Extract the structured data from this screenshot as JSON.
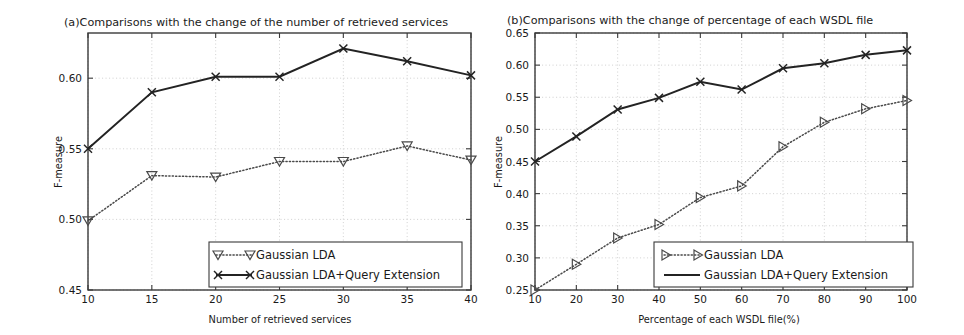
{
  "figure": {
    "background_color": "#ffffff",
    "line_color": "#232323",
    "dotted_color": "#4a4a4a",
    "grid_color": "#c9c9c9"
  },
  "panel_a": {
    "title": "(a)Comparisons with the change of the number of retrieved services",
    "xlabel": "Number of retrieved services",
    "ylabel": "F-measure",
    "legend": {
      "entry_1": "Gaussian LDA",
      "entry_2": "Gaussian LDA+Query Extension"
    },
    "ytick_labels": [
      "0.45",
      "0.50",
      "0.55",
      "0.60"
    ],
    "xtick_labels": [
      "10",
      "15",
      "20",
      "25",
      "30",
      "35",
      "40"
    ]
  },
  "panel_b": {
    "title": "(b)Comparisons with the change of percentage of each WSDL file",
    "xlabel": "Percentage of each WSDL file(%)",
    "ylabel": "F-measure",
    "legend": {
      "entry_1": "Gaussian LDA",
      "entry_2": "Gaussian LDA+Query Extension"
    },
    "ytick_labels": [
      "0.25",
      "0.30",
      "0.35",
      "0.40",
      "0.45",
      "0.50",
      "0.55",
      "0.60",
      "0.65"
    ],
    "xtick_labels": [
      "10",
      "20",
      "30",
      "40",
      "50",
      "60",
      "70",
      "80",
      "90",
      "100"
    ]
  },
  "chart_data": [
    {
      "type": "line",
      "panel": "a",
      "title": "(a)Comparisons with the change of the number of retrieved services",
      "xlabel": "Number of retrieved services",
      "ylabel": "F-measure",
      "x": [
        10,
        15,
        20,
        25,
        30,
        35,
        40
      ],
      "xlim": [
        10,
        40
      ],
      "ylim": [
        0.45,
        0.632
      ],
      "yticks": [
        0.45,
        0.5,
        0.55,
        0.6
      ],
      "xticks": [
        10,
        15,
        20,
        25,
        30,
        35,
        40
      ],
      "grid": true,
      "legend_position": "lower right",
      "series": [
        {
          "name": "Gaussian LDA",
          "marker": "triangle-down",
          "linestyle": "dotted",
          "values": [
            0.499,
            0.531,
            0.53,
            0.541,
            0.541,
            0.552,
            0.542
          ]
        },
        {
          "name": "Gaussian LDA+Query Extension",
          "marker": "x",
          "linestyle": "solid",
          "values": [
            0.55,
            0.59,
            0.601,
            0.601,
            0.621,
            0.612,
            0.602
          ]
        }
      ]
    },
    {
      "type": "line",
      "panel": "b",
      "title": "(b)Comparisons with the change of percentage of each WSDL file",
      "xlabel": "Percentage of each WSDL file(%)",
      "ylabel": "F-measure",
      "x": [
        10,
        20,
        30,
        40,
        50,
        60,
        70,
        80,
        90,
        100
      ],
      "xlim": [
        10,
        100
      ],
      "ylim": [
        0.25,
        0.65
      ],
      "yticks": [
        0.25,
        0.3,
        0.35,
        0.4,
        0.45,
        0.5,
        0.55,
        0.6,
        0.65
      ],
      "xticks": [
        10,
        20,
        30,
        40,
        50,
        60,
        70,
        80,
        90,
        100
      ],
      "grid": true,
      "legend_position": "lower right",
      "series": [
        {
          "name": "Gaussian LDA",
          "marker": "triangle-right",
          "linestyle": "dotted",
          "values": [
            0.25,
            0.29,
            0.331,
            0.352,
            0.394,
            0.412,
            0.473,
            0.511,
            0.532,
            0.545
          ]
        },
        {
          "name": "Gaussian LDA+Query Extension",
          "marker": "x",
          "linestyle": "solid",
          "values": [
            0.45,
            0.489,
            0.531,
            0.549,
            0.574,
            0.562,
            0.595,
            0.603,
            0.616,
            0.623
          ]
        }
      ]
    }
  ]
}
